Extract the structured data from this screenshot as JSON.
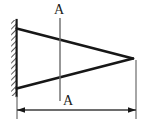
{
  "diagram": {
    "type": "engineering-drawing",
    "canvas": {
      "width": 145,
      "height": 122
    },
    "colors": {
      "background": "#ffffff",
      "stroke": "#171717",
      "thin_stroke": "#555555",
      "hatch": "#2a2a2a",
      "text": "#1a1a1a"
    },
    "labels": {
      "section_top": "A",
      "section_bottom": "A"
    },
    "geometry": {
      "wall": {
        "face_x": 16.5,
        "top_y": 20,
        "bottom_y": 96,
        "hatch_width": 5,
        "hatch_count": 26
      },
      "beam": {
        "root_top": {
          "x": 16.5,
          "y": 28.5
        },
        "root_bottom": {
          "x": 16.5,
          "y": 88.5
        },
        "tip": {
          "x": 133,
          "y": 58.5
        },
        "edge_width": 2.6
      },
      "section_line": {
        "x": 60,
        "top_y": 18,
        "bottom_y": 101
      },
      "dimension": {
        "y": 110,
        "left_x": 17,
        "right_x": 136,
        "arrow_length": 7,
        "arrow_half_height": 3,
        "extension_left": {
          "x": 17,
          "top_y": 96,
          "bottom_y": 119
        },
        "extension_right": {
          "x": 136,
          "top_y": 60,
          "bottom_y": 119
        }
      },
      "label_positions": {
        "section_top": {
          "x": 59,
          "y": 14
        },
        "section_bottom": {
          "x": 68,
          "y": 105
        }
      }
    }
  }
}
